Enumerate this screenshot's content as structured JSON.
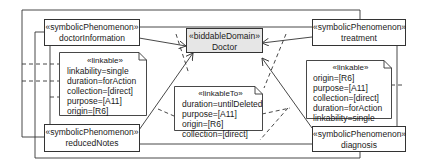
{
  "diagram": {
    "type": "problem-frame-diagram",
    "domains": [
      {
        "id": "doctor",
        "stereotype": "«biddableDomain»",
        "name": "Doctor"
      }
    ],
    "phenomena": [
      {
        "id": "doctorInformation",
        "stereotype": "«symbolicPhenomenon»",
        "name": "doctorInformation"
      },
      {
        "id": "treatment",
        "stereotype": "«symbolicPhenomenon»",
        "name": "treatment"
      },
      {
        "id": "reducedNotes",
        "stereotype": "«symbolicPhenomenon»",
        "name": "reducedNotes"
      },
      {
        "id": "diagnosis",
        "stereotype": "«symbolicPhenomenon»",
        "name": "diagnosis"
      }
    ],
    "notes": {
      "left": {
        "stereotype": "«linkable»",
        "lines": [
          "linkability=single",
          "duration=forAction",
          "collection=[direct]",
          "purpose=[A11]",
          "origin=[R6]"
        ]
      },
      "center": {
        "stereotype": "«linkableTo»",
        "lines": [
          "duration=untilDeleted",
          "purpose=[A11]",
          "origin=[R6]",
          "collection=[direct]"
        ]
      },
      "right": {
        "stereotype": "«linkable»",
        "lines": [
          "origin=[R6]",
          "purpose=[A11]",
          "collection=[direct]",
          "duration=forAction",
          "linkability=single"
        ]
      }
    },
    "colors": {
      "line": "#333333",
      "domain_fill": "#e6e6e6",
      "box_fill": "#ffffff"
    }
  }
}
